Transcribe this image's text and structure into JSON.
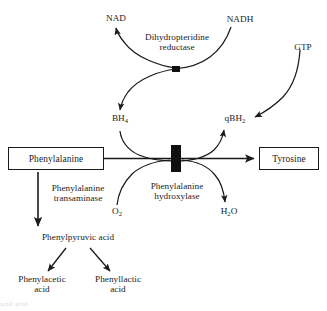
{
  "diagram": {
    "type": "biochemical-pathway",
    "background_color": "#ffffff",
    "line_color": "#1a1a1a",
    "text_color": "#1c1c1c",
    "boxed_nodes": [
      {
        "id": "phenylalanine",
        "label": "Phenylalanine"
      },
      {
        "id": "tyrosine",
        "label": "Tyrosine"
      }
    ],
    "plain_nodes": [
      {
        "id": "nad",
        "label": "NAD",
        "sub": ""
      },
      {
        "id": "nadh",
        "label": "NADH",
        "sub": ""
      },
      {
        "id": "gtp",
        "label": "GTP",
        "sub": ""
      },
      {
        "id": "bh4",
        "label": "BH",
        "sub": "4"
      },
      {
        "id": "qbh2",
        "label": "qBH",
        "sub": "2"
      },
      {
        "id": "o2",
        "label": "O",
        "sub": "2"
      },
      {
        "id": "h2o",
        "label": "H",
        "sub": "2",
        "label_tail": "O"
      },
      {
        "id": "phenylpyruvic",
        "label": "Phenylpyruvic acid"
      },
      {
        "id": "phenylacetic",
        "label": "Phenylacetic",
        "line2": "acid"
      },
      {
        "id": "phenyllactic",
        "label": "Phenyllactic",
        "line2": "acid"
      }
    ],
    "enzyme_labels": [
      {
        "id": "dihydropteridine-reductase",
        "line1": "Dihydropteridine",
        "line2": "reductase"
      },
      {
        "id": "phenylalanine-hydroxylase",
        "line1": "Phenylalanine",
        "line2": "hydroxylase"
      },
      {
        "id": "phenylalanine-transaminase",
        "line1": "Phenylalanine",
        "line2": "transaminase"
      }
    ],
    "enzyme_markers": [
      {
        "id": "upper-enzyme-bar"
      },
      {
        "id": "lower-enzyme-bar"
      }
    ],
    "edges": [
      {
        "id": "qbh2-to-nad",
        "from": "qBH2",
        "to": "NAD",
        "style": "curved-arrow"
      },
      {
        "id": "nadh-to-cycle",
        "from": "NADH",
        "to": "upper-enzyme-bar",
        "style": "curved"
      },
      {
        "id": "cycle-to-bh4",
        "from": "upper-enzyme-bar",
        "to": "BH4",
        "style": "curved-arrow"
      },
      {
        "id": "bh4-to-qbh2",
        "from": "BH4",
        "to": "qBH2",
        "style": "curved-arrow"
      },
      {
        "id": "gtp-to-qbh2",
        "from": "GTP",
        "to": "qBH2",
        "style": "curved-arrow"
      },
      {
        "id": "phenylalanine-to-tyrosine",
        "from": "Phenylalanine",
        "to": "Tyrosine",
        "style": "straight-arrow"
      },
      {
        "id": "o2-to-reaction",
        "from": "O2",
        "to": "lower-enzyme-bar",
        "style": "curved"
      },
      {
        "id": "reaction-to-h2o",
        "from": "lower-enzyme-bar",
        "to": "H2O",
        "style": "curved-arrow"
      },
      {
        "id": "phenylalanine-to-phenylpyruvic",
        "from": "Phenylalanine",
        "to": "Phenylpyruvic acid",
        "style": "straight-arrow"
      },
      {
        "id": "phenylpyruvic-to-phenylacetic",
        "from": "Phenylpyruvic acid",
        "to": "Phenylacetic acid",
        "style": "straight-arrow"
      },
      {
        "id": "phenylpyruvic-to-phenyllactic",
        "from": "Phenylpyruvic acid",
        "to": "Phenyllactic acid",
        "style": "straight-arrow"
      }
    ],
    "footer_artifact": "acid                       acid"
  }
}
